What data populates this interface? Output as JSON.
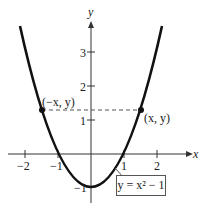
{
  "diagram": {
    "equation_label": "y = x² − 1",
    "axes": {
      "x_label": "x",
      "y_label": "y",
      "x_ticks": [
        "−2",
        "−1",
        "1",
        "2"
      ],
      "y_ticks": [
        "3",
        "2",
        "1",
        "−1"
      ]
    },
    "points": [
      {
        "label": "(−x, y)",
        "x": -1.5,
        "y": 1.25
      },
      {
        "label": "(x, y)",
        "x": 1.5,
        "y": 1.25
      }
    ],
    "colors": {
      "curve": "#111111",
      "axes": "#333333",
      "dashed": "#555555"
    }
  }
}
